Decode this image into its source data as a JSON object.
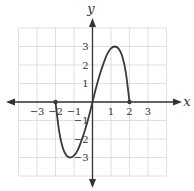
{
  "chart_data": {
    "type": "line",
    "title": "",
    "xlabel": "x",
    "ylabel": "y",
    "xlim": [
      -4,
      4
    ],
    "ylim": [
      -4,
      4
    ],
    "grid": true,
    "grid_range": {
      "x": [
        -4,
        4
      ],
      "y": [
        -4,
        4
      ]
    },
    "x_ticks": [
      -3,
      -2,
      -1,
      1,
      2,
      3
    ],
    "y_ticks": [
      -3,
      -2,
      -1,
      1,
      2,
      3
    ],
    "x_tick_labels": [
      "−3",
      "−2",
      "−1",
      "1",
      "2",
      "3"
    ],
    "y_tick_labels": [
      "−3",
      "−2",
      "−1",
      "1",
      "2",
      "3"
    ],
    "series": [
      {
        "name": "f(x)",
        "x": [
          -2,
          -1.8,
          -1.6,
          -1.4,
          -1.2,
          -1.0,
          -0.8,
          -0.6,
          -0.4,
          -0.2,
          0,
          0.2,
          0.4,
          0.6,
          0.8,
          1.0,
          1.2,
          1.4,
          1.6,
          1.8,
          2
        ],
        "y": [
          0,
          -1.6,
          -2.5,
          -2.9,
          -3.0,
          -2.9,
          -2.6,
          -2.1,
          -1.5,
          -0.8,
          0,
          0.8,
          1.5,
          2.1,
          2.6,
          2.9,
          3.0,
          2.9,
          2.5,
          1.6,
          0
        ],
        "endpoints": [
          [
            -2,
            0
          ],
          [
            2,
            0
          ]
        ],
        "color": "#3a3a3a"
      }
    ],
    "colors": {
      "grid": "#d8d8d8",
      "axis": "#333333",
      "curve": "#3a3a3a"
    }
  }
}
